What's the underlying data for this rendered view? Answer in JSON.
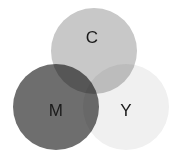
{
  "figure": {
    "background_color": "#ffffff",
    "width": 175,
    "height": 166
  },
  "chart_data": {
    "type": "venn",
    "subtitle": "",
    "xlabel": "",
    "ylabel": "",
    "grid": false,
    "legend": "none",
    "blend_mode": "multiply",
    "background_color": "#ffffff",
    "sets": [
      {
        "id": "C",
        "label": "C",
        "name": "Cyan",
        "cx": 94,
        "cy": 51,
        "r": 43,
        "fill": "#c8c8c8",
        "opacity": 1,
        "label_x": 92,
        "label_y": 37
      },
      {
        "id": "M",
        "label": "M",
        "name": "Magenta",
        "cx": 56,
        "cy": 107,
        "r": 43,
        "fill": "#6e6e6e",
        "opacity": 1,
        "label_x": 56,
        "label_y": 110
      },
      {
        "id": "Y",
        "label": "Y",
        "name": "Yellow",
        "cx": 126,
        "cy": 107,
        "r": 43,
        "fill": "#f0f0f0",
        "opacity": 1,
        "label_x": 126,
        "label_y": 110
      }
    ],
    "regions": [
      {
        "id": "C-only",
        "sets": [
          "C"
        ],
        "observed_color": "#c8c8c8"
      },
      {
        "id": "M-only",
        "sets": [
          "M"
        ],
        "observed_color": "#5a5a5a"
      },
      {
        "id": "Y-only",
        "sets": [
          "Y"
        ],
        "observed_color": "#f0f0f0"
      },
      {
        "id": "C-and-M",
        "sets": [
          "C",
          "M"
        ],
        "observed_color": "#3f3f3f"
      },
      {
        "id": "C-and-Y",
        "sets": [
          "C",
          "Y"
        ],
        "observed_color": "#bdbdbd"
      },
      {
        "id": "M-and-Y",
        "sets": [
          "M",
          "Y"
        ],
        "observed_color": "#555555"
      },
      {
        "id": "C-M-Y",
        "sets": [
          "C",
          "M",
          "Y"
        ],
        "observed_color": "#141414"
      }
    ],
    "labels": [
      {
        "text": "C",
        "x": 92,
        "y": 37,
        "color": "#1a1a1a",
        "font_size": 17
      },
      {
        "text": "M",
        "x": 56,
        "y": 110,
        "color": "#1a1a1a",
        "font_size": 17
      },
      {
        "text": "Y",
        "x": 126,
        "y": 110,
        "color": "#1a1a1a",
        "font_size": 17
      }
    ]
  }
}
